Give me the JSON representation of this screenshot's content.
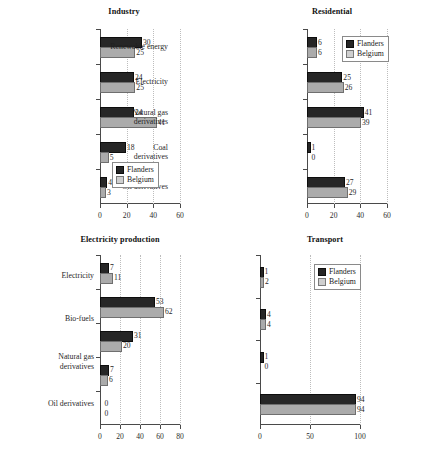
{
  "figure": {
    "series_names": [
      "Flanders",
      "Belgium"
    ],
    "colors": {
      "flanders": "#262626",
      "belgium": "#ababab"
    },
    "legend_labels": {
      "flanders": "Flanders",
      "belgium": "Belgium"
    }
  },
  "chart_data": [
    {
      "type": "bar",
      "title": "Industry",
      "orientation": "horizontal",
      "xlabel": "",
      "ylabel": "",
      "xlim": [
        0,
        60
      ],
      "xticks": [
        0,
        20,
        40,
        60
      ],
      "grid": true,
      "legend_position": "bottom-right",
      "categories": [
        "Renewable energy",
        "Electricity",
        "Natural gas and derivatives",
        "Coal and derivatives",
        "Oil derivatives"
      ],
      "series": [
        {
          "name": "Flanders",
          "values": [
            30,
            24,
            24,
            18,
            4
          ]
        },
        {
          "name": "Belgium",
          "values": [
            25,
            25,
            41,
            5,
            3
          ]
        }
      ]
    },
    {
      "type": "bar",
      "title": "Residential",
      "orientation": "horizontal",
      "xlabel": "",
      "ylabel": "",
      "xlim": [
        0,
        60
      ],
      "xticks": [
        0,
        20,
        40,
        60
      ],
      "grid": true,
      "legend_position": "top-right",
      "categories": [
        "Renewable energy",
        "Electricity",
        "Natural gas and derivatives",
        "Coal and derivatives",
        "Oil derivatives"
      ],
      "series": [
        {
          "name": "Flanders",
          "values": [
            6,
            25,
            41,
            1,
            27
          ]
        },
        {
          "name": "Belgium",
          "values": [
            6,
            26,
            39,
            0,
            29
          ]
        }
      ]
    },
    {
      "type": "bar",
      "title": "Electricity production",
      "orientation": "horizontal",
      "xlabel": "",
      "ylabel": "",
      "xlim": [
        0,
        80
      ],
      "xticks": [
        0,
        20,
        40,
        60,
        80
      ],
      "grid": true,
      "legend_position": "bottom-right",
      "categories": [
        "Renewable energy",
        "Nuclear",
        "Natural gas and derivatives",
        "Coal and derivatives",
        "Oil derivatives"
      ],
      "series": [
        {
          "name": "Flanders",
          "values": [
            7,
            53,
            31,
            7,
            0
          ]
        },
        {
          "name": "Belgium",
          "values": [
            11,
            62,
            20,
            6,
            0
          ]
        }
      ]
    },
    {
      "type": "bar",
      "title": "Transport",
      "orientation": "horizontal",
      "xlabel": "",
      "ylabel": "",
      "xlim": [
        0,
        100
      ],
      "xticks": [
        0,
        50,
        100
      ],
      "grid": true,
      "legend_position": "top-right",
      "categories": [
        "Electricity",
        "Bio-fuels",
        "Natural gas and derivatives",
        "Oil derivatives"
      ],
      "series": [
        {
          "name": "Flanders",
          "values": [
            1,
            4,
            1,
            94
          ]
        },
        {
          "name": "Belgium",
          "values": [
            2,
            4,
            0,
            94
          ]
        }
      ]
    }
  ]
}
